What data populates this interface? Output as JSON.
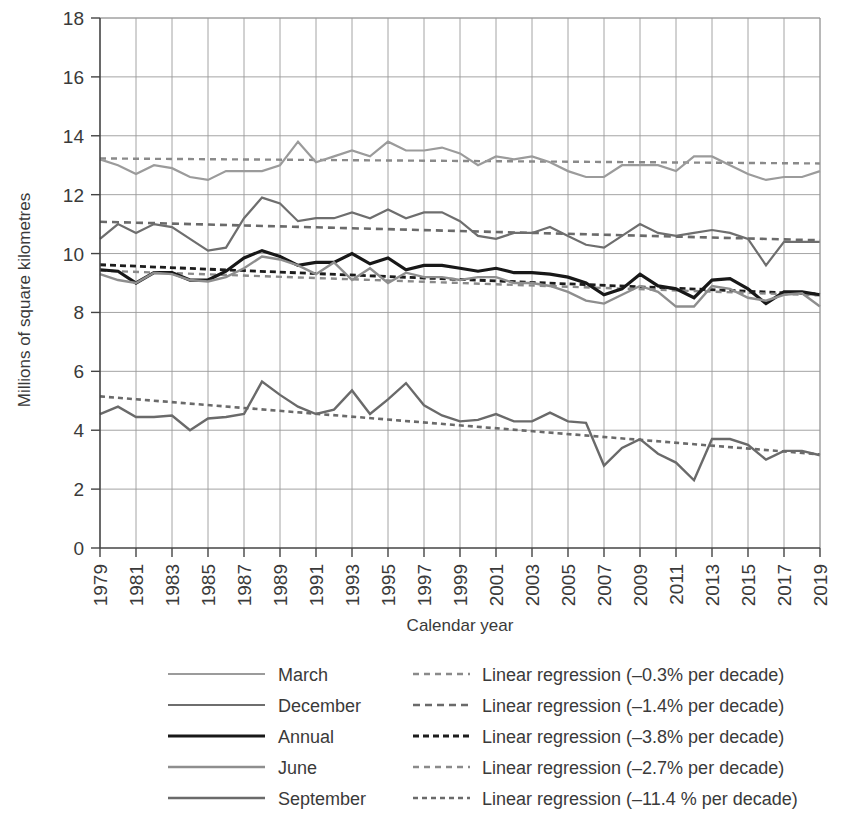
{
  "chart_data": {
    "type": "line",
    "title": "",
    "xlabel": "Calendar year",
    "ylabel": "Millions of square kilometres",
    "xlim": [
      1979,
      2019
    ],
    "ylim": [
      0,
      18
    ],
    "ytick_step": 2,
    "yticks": [
      "0",
      "2",
      "4",
      "6",
      "8",
      "10",
      "12",
      "14",
      "16",
      "18"
    ],
    "xticks": [
      "1979",
      "1981",
      "1983",
      "1985",
      "1987",
      "1989",
      "1991",
      "1993",
      "1995",
      "1997",
      "1999",
      "2001",
      "2003",
      "2005",
      "2007",
      "2009",
      "2011",
      "2013",
      "2015",
      "2017",
      "2019"
    ],
    "xtick_rotation": -90,
    "grid": "both",
    "legend_position": "below",
    "x": [
      1979,
      1980,
      1981,
      1982,
      1983,
      1984,
      1985,
      1986,
      1987,
      1988,
      1989,
      1990,
      1991,
      1992,
      1993,
      1994,
      1995,
      1996,
      1997,
      1998,
      1999,
      2000,
      2001,
      2002,
      2003,
      2004,
      2005,
      2006,
      2007,
      2008,
      2009,
      2010,
      2011,
      2012,
      2013,
      2014,
      2015,
      2016,
      2017,
      2018,
      2019
    ],
    "series": [
      {
        "name": "March",
        "color": "#9b9b9b",
        "width": 2.2,
        "values": [
          13.2,
          13.0,
          12.7,
          13.0,
          12.9,
          12.6,
          12.5,
          12.8,
          12.8,
          12.8,
          13.0,
          13.8,
          13.1,
          13.3,
          13.5,
          13.3,
          13.8,
          13.5,
          13.5,
          13.6,
          13.4,
          13.0,
          13.3,
          13.2,
          13.3,
          13.1,
          12.8,
          12.6,
          12.6,
          13.0,
          13.0,
          13.0,
          12.8,
          13.3,
          13.3,
          13.0,
          12.7,
          12.5,
          12.6,
          12.6,
          12.8
        ],
        "trend": {
          "name": "Linear regression (–0.3% per decade)",
          "start": 13.23,
          "end": 13.06,
          "color": "#8a8a8a",
          "width": 2.4,
          "dash": "6,5"
        }
      },
      {
        "name": "December",
        "color": "#6e6e6e",
        "width": 2.2,
        "values": [
          10.5,
          11.0,
          10.7,
          11.0,
          10.9,
          10.5,
          10.1,
          10.2,
          11.2,
          11.9,
          11.7,
          11.1,
          11.2,
          11.2,
          11.4,
          11.2,
          11.5,
          11.2,
          11.4,
          11.4,
          11.1,
          10.6,
          10.5,
          10.7,
          10.7,
          10.9,
          10.6,
          10.3,
          10.2,
          10.6,
          11.0,
          10.7,
          10.6,
          10.7,
          10.8,
          10.7,
          10.5,
          9.6,
          10.4,
          10.4,
          10.4
        ],
        "trend": {
          "name": "Linear regression (–1.4% per decade)",
          "start": 11.08,
          "end": 10.45,
          "color": "#6a6a6a",
          "width": 2.6,
          "dash": "7,5"
        }
      },
      {
        "name": "Annual",
        "color": "#181818",
        "width": 3.2,
        "values": [
          9.45,
          9.4,
          9.0,
          9.35,
          9.35,
          9.1,
          9.1,
          9.4,
          9.85,
          10.1,
          9.9,
          9.6,
          9.7,
          9.7,
          10.0,
          9.65,
          9.85,
          9.45,
          9.6,
          9.6,
          9.5,
          9.4,
          9.5,
          9.35,
          9.35,
          9.3,
          9.2,
          9.0,
          8.6,
          8.8,
          9.3,
          8.9,
          8.8,
          8.5,
          9.1,
          9.15,
          8.8,
          8.3,
          8.7,
          8.7,
          8.6
        ],
        "trend": {
          "name": "Linear regression (–3.8% per decade)",
          "start": 9.62,
          "end": 8.62,
          "color": "#1c1c1c",
          "width": 2.8,
          "dash": "6,4"
        }
      },
      {
        "name": "June",
        "color": "#8e8e8e",
        "width": 2.4,
        "values": [
          9.3,
          9.1,
          9.0,
          9.35,
          9.3,
          9.1,
          9.05,
          9.2,
          9.5,
          9.9,
          9.8,
          9.6,
          9.3,
          9.7,
          9.1,
          9.5,
          9.0,
          9.35,
          9.2,
          9.2,
          9.1,
          9.2,
          9.2,
          9.0,
          9.0,
          8.9,
          8.7,
          8.4,
          8.3,
          8.6,
          8.9,
          8.7,
          8.2,
          8.2,
          8.9,
          8.8,
          8.5,
          8.4,
          8.6,
          8.65,
          8.2
        ],
        "trend": {
          "name": "Linear regression (–2.7% per decade)",
          "start": 9.42,
          "end": 8.58,
          "color": "#8a8a8a",
          "width": 2.4,
          "dash": "6,5"
        }
      },
      {
        "name": "September",
        "color": "#6a6a6a",
        "width": 2.4,
        "values": [
          4.55,
          4.8,
          4.45,
          4.45,
          4.5,
          4.0,
          4.4,
          4.45,
          4.55,
          5.65,
          5.2,
          4.8,
          4.55,
          4.7,
          5.35,
          4.55,
          5.05,
          5.6,
          4.85,
          4.5,
          4.3,
          4.35,
          4.55,
          4.3,
          4.3,
          4.6,
          4.3,
          4.25,
          2.8,
          3.4,
          3.7,
          3.2,
          2.9,
          2.3,
          3.7,
          3.7,
          3.5,
          3.0,
          3.3,
          3.3,
          3.15
        ],
        "trend": {
          "name": "Linear regression (–11.4 % per decade)",
          "start": 5.15,
          "end": 3.18,
          "color": "#6a6a6a",
          "width": 2.6,
          "dash": "5,4"
        }
      }
    ]
  },
  "legend": {
    "entries": [
      {
        "series_label": "March",
        "trend_label": "Linear regression (–0.3% per decade)"
      },
      {
        "series_label": "December",
        "trend_label": "Linear regression (–1.4% per decade)"
      },
      {
        "series_label": "Annual",
        "trend_label": "Linear regression (–3.8% per decade)"
      },
      {
        "series_label": "June",
        "trend_label": "Linear regression (–2.7% per decade)"
      },
      {
        "series_label": "September",
        "trend_label": "Linear regression (–11.4 % per decade)"
      }
    ]
  }
}
